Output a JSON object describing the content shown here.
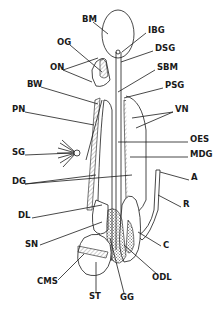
{
  "diagram": {
    "type": "anatomical line drawing",
    "labels": [
      {
        "id": "BM",
        "text": "BM",
        "x": 82,
        "y": 22
      },
      {
        "id": "IBG",
        "text": "IBG",
        "x": 148,
        "y": 33
      },
      {
        "id": "OG",
        "text": "OG",
        "x": 57,
        "y": 45
      },
      {
        "id": "DSG",
        "text": "DSG",
        "x": 155,
        "y": 51
      },
      {
        "id": "ON",
        "text": "ON",
        "x": 50,
        "y": 70
      },
      {
        "id": "SBM",
        "text": "SBM",
        "x": 157,
        "y": 70
      },
      {
        "id": "BW",
        "text": "BW",
        "x": 27,
        "y": 87
      },
      {
        "id": "PSG",
        "text": "PSG",
        "x": 165,
        "y": 88
      },
      {
        "id": "PN",
        "text": "PN",
        "x": 12,
        "y": 112
      },
      {
        "id": "VN",
        "text": "VN",
        "x": 175,
        "y": 112
      },
      {
        "id": "OES",
        "text": "OES",
        "x": 190,
        "y": 142
      },
      {
        "id": "SG",
        "text": "SG",
        "x": 12,
        "y": 155
      },
      {
        "id": "MDG",
        "text": "MDG",
        "x": 190,
        "y": 157
      },
      {
        "id": "DG",
        "text": "DG",
        "x": 12,
        "y": 184
      },
      {
        "id": "A",
        "text": "A",
        "x": 191,
        "y": 180
      },
      {
        "id": "R",
        "text": "R",
        "x": 183,
        "y": 207
      },
      {
        "id": "DL",
        "text": "DL",
        "x": 18,
        "y": 218
      },
      {
        "id": "SN",
        "text": "SN",
        "x": 25,
        "y": 247
      },
      {
        "id": "C",
        "text": "C",
        "x": 163,
        "y": 248
      },
      {
        "id": "ODL",
        "text": "ODL",
        "x": 152,
        "y": 280
      },
      {
        "id": "CMS",
        "text": "CMS",
        "x": 37,
        "y": 284
      },
      {
        "id": "ST",
        "text": "ST",
        "x": 89,
        "y": 299
      },
      {
        "id": "GG",
        "text": "GG",
        "x": 120,
        "y": 300
      }
    ]
  },
  "colors": {
    "ink": "#1a1a1a",
    "background": "#ffffff"
  }
}
